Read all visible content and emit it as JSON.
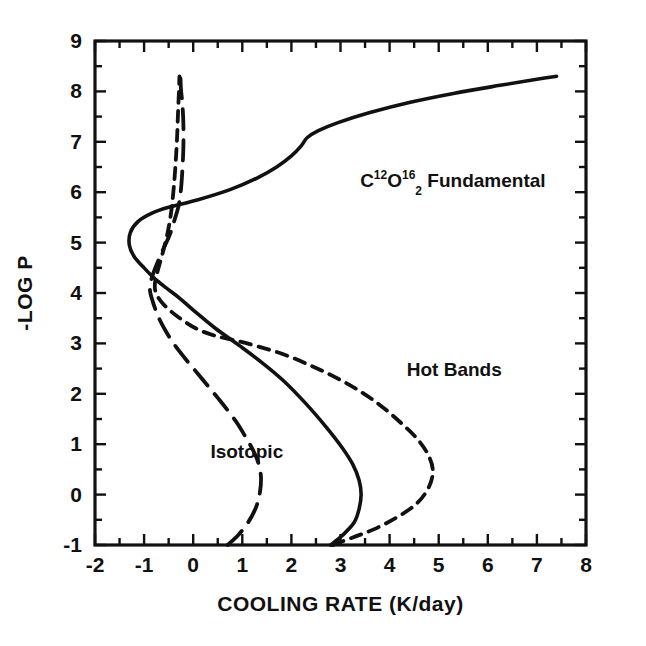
{
  "chart_data": {
    "type": "line",
    "title": "",
    "xlabel": "COOLING RATE (K/day)",
    "ylabel": "-LOG P",
    "xlim": [
      -2,
      8
    ],
    "ylim": [
      -1,
      9
    ],
    "xticks": [
      -2,
      -1,
      0,
      1,
      2,
      3,
      4,
      5,
      6,
      7,
      8
    ],
    "xtick_labels": [
      "-2",
      "-1",
      "0",
      "1",
      "2",
      "3",
      "4",
      "5",
      "6",
      "7",
      "8"
    ],
    "yticks": [
      -1,
      0,
      1,
      2,
      3,
      4,
      5,
      6,
      7,
      8,
      9
    ],
    "ytick_labels": [
      "-1",
      "0",
      "1",
      "2",
      "3",
      "4",
      "5",
      "6",
      "7",
      "8",
      "9"
    ],
    "xminor_step": 0.5,
    "yminor_step": 0.5,
    "grid": false,
    "legend_position": "inline-annotations",
    "orientation": "x = cooling rate, y = -log P (pressure decreasing upward)",
    "series": [
      {
        "name": "co2-fundamental",
        "label_plain": "C12O2 16 Fundamental",
        "linestyle": "solid",
        "color": "#111111",
        "points": [
          [
            2.8,
            -1.0
          ],
          [
            3.05,
            -0.8
          ],
          [
            3.28,
            -0.55
          ],
          [
            3.38,
            -0.28
          ],
          [
            3.42,
            0.0
          ],
          [
            3.38,
            0.28
          ],
          [
            3.25,
            0.6
          ],
          [
            3.02,
            0.95
          ],
          [
            2.7,
            1.35
          ],
          [
            2.3,
            1.8
          ],
          [
            1.85,
            2.25
          ],
          [
            1.4,
            2.62
          ],
          [
            0.95,
            2.95
          ],
          [
            0.45,
            3.3
          ],
          [
            0.05,
            3.62
          ],
          [
            -0.28,
            3.9
          ],
          [
            -0.55,
            4.1
          ],
          [
            -0.8,
            4.3
          ],
          [
            -1.02,
            4.52
          ],
          [
            -1.2,
            4.72
          ],
          [
            -1.3,
            4.95
          ],
          [
            -1.28,
            5.2
          ],
          [
            -1.12,
            5.42
          ],
          [
            -0.85,
            5.58
          ],
          [
            -0.5,
            5.7
          ],
          [
            0.1,
            5.85
          ],
          [
            0.75,
            6.05
          ],
          [
            1.3,
            6.28
          ],
          [
            1.7,
            6.5
          ],
          [
            2.0,
            6.72
          ],
          [
            2.2,
            6.92
          ],
          [
            2.32,
            7.08
          ],
          [
            2.55,
            7.22
          ],
          [
            2.95,
            7.38
          ],
          [
            3.6,
            7.58
          ],
          [
            4.4,
            7.78
          ],
          [
            5.3,
            7.96
          ],
          [
            6.25,
            8.12
          ],
          [
            7.0,
            8.24
          ],
          [
            7.4,
            8.3
          ]
        ]
      },
      {
        "name": "hot-bands",
        "label_plain": "Hot Bands",
        "linestyle": "short-dashed",
        "color": "#111111",
        "points": [
          [
            2.85,
            -1.0
          ],
          [
            3.25,
            -0.85
          ],
          [
            3.7,
            -0.68
          ],
          [
            4.15,
            -0.45
          ],
          [
            4.55,
            -0.18
          ],
          [
            4.8,
            0.15
          ],
          [
            4.88,
            0.48
          ],
          [
            4.78,
            0.8
          ],
          [
            4.55,
            1.12
          ],
          [
            4.2,
            1.45
          ],
          [
            3.8,
            1.78
          ],
          [
            3.35,
            2.08
          ],
          [
            2.85,
            2.35
          ],
          [
            2.35,
            2.58
          ],
          [
            1.85,
            2.78
          ],
          [
            1.35,
            2.93
          ],
          [
            0.9,
            3.05
          ],
          [
            0.45,
            3.15
          ],
          [
            0.05,
            3.3
          ],
          [
            -0.3,
            3.52
          ],
          [
            -0.58,
            3.75
          ],
          [
            -0.75,
            3.98
          ],
          [
            -0.78,
            4.18
          ],
          [
            -0.72,
            4.45
          ],
          [
            -0.62,
            4.8
          ],
          [
            -0.52,
            5.2
          ],
          [
            -0.45,
            5.6
          ],
          [
            -0.4,
            6.05
          ],
          [
            -0.36,
            6.55
          ],
          [
            -0.33,
            7.05
          ],
          [
            -0.31,
            7.55
          ],
          [
            -0.29,
            8.0
          ],
          [
            -0.28,
            8.3
          ]
        ]
      },
      {
        "name": "isotopic",
        "label_plain": "Isotopic",
        "linestyle": "long-dashed",
        "color": "#111111",
        "points": [
          [
            0.7,
            -1.0
          ],
          [
            0.92,
            -0.8
          ],
          [
            1.12,
            -0.55
          ],
          [
            1.28,
            -0.25
          ],
          [
            1.36,
            0.05
          ],
          [
            1.38,
            0.35
          ],
          [
            1.33,
            0.62
          ],
          [
            1.22,
            0.88
          ],
          [
            1.08,
            1.12
          ],
          [
            0.92,
            1.38
          ],
          [
            0.72,
            1.65
          ],
          [
            0.5,
            1.92
          ],
          [
            0.28,
            2.18
          ],
          [
            0.05,
            2.45
          ],
          [
            -0.18,
            2.72
          ],
          [
            -0.4,
            3.0
          ],
          [
            -0.58,
            3.28
          ],
          [
            -0.72,
            3.55
          ],
          [
            -0.82,
            3.82
          ],
          [
            -0.88,
            4.05
          ],
          [
            -0.85,
            4.28
          ],
          [
            -0.75,
            4.55
          ],
          [
            -0.62,
            4.85
          ],
          [
            -0.48,
            5.15
          ],
          [
            -0.38,
            5.45
          ],
          [
            -0.3,
            5.72
          ],
          [
            -0.25,
            6.05
          ],
          [
            -0.22,
            6.45
          ],
          [
            -0.2,
            6.9
          ],
          [
            -0.2,
            7.35
          ],
          [
            -0.22,
            7.75
          ],
          [
            -0.25,
            8.05
          ],
          [
            -0.26,
            8.32
          ]
        ]
      }
    ],
    "annotations": [
      {
        "name": "co2-fundamental",
        "prefix": "C",
        "sup1": "12",
        "element2": "O",
        "sup2": "16",
        "sub2": "2",
        "suffix": "Fundamental",
        "x": 3.4,
        "y": 6.1
      },
      {
        "name": "hot-bands",
        "text": "Hot Bands",
        "x": 4.35,
        "y": 2.35
      },
      {
        "name": "isotopic",
        "text": "Isotopic",
        "x": 0.35,
        "y": 0.72
      }
    ]
  }
}
